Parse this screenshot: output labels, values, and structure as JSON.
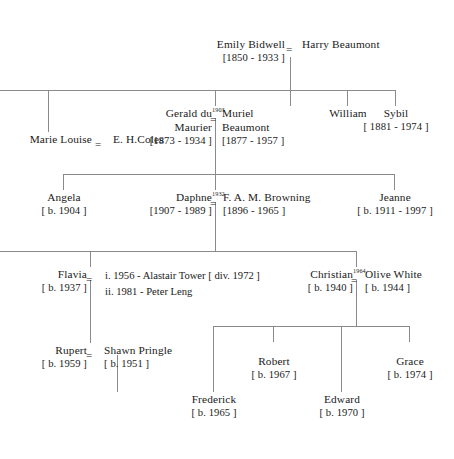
{
  "diagram": {
    "type": "family-tree",
    "line_color": "#8a8a8a",
    "text_color": "#1a1a1a",
    "marriage_symbol": "=",
    "generations": [
      {
        "gen": 1,
        "people": [
          {
            "name": "Emily Bidwell",
            "dates": "[1850 - 1933 ]"
          },
          {
            "name": "Harry Beaumont",
            "dates": ""
          }
        ]
      },
      {
        "gen": 2,
        "people": [
          {
            "name": "Marie Louise",
            "dates": ""
          },
          {
            "name": "E. H.Coles",
            "dates": ""
          },
          {
            "name": "Gerald du Maurier",
            "dates": "[1873 - 1934 ]"
          },
          {
            "name": "Muriel Beaumont",
            "dates": "[1877 - 1957 ]"
          },
          {
            "name": "William",
            "dates": ""
          },
          {
            "name": "Sybil",
            "dates": "[ 1881 - 1974 ]"
          }
        ],
        "marriage_years": [
          "1903"
        ]
      },
      {
        "gen": 3,
        "people": [
          {
            "name": "Angela",
            "dates": "[ b. 1904  ]"
          },
          {
            "name": "Daphne",
            "dates": "[1907 - 1989 ]"
          },
          {
            "name": "F. A. M. Browning",
            "dates": "[1896 - 1965 ]"
          },
          {
            "name": "Jeanne",
            "dates": "[ b. 1911 - 1997 ]"
          }
        ],
        "marriage_years": [
          "1932"
        ]
      },
      {
        "gen": 4,
        "people": [
          {
            "name": "Flavia",
            "dates": "[ b. 1937 ]"
          },
          {
            "name": "Christian",
            "dates": "[ b. 1940 ]"
          },
          {
            "name": "Olive White",
            "dates": "[ b. 1944 ]"
          }
        ],
        "marriage_years": [
          "1964"
        ],
        "notes": [
          "i. 1956 - Alastair Tower [ div. 1972 ]",
          "ii. 1981 - Peter Leng"
        ]
      },
      {
        "gen": 5,
        "people": [
          {
            "name": "Rupert",
            "dates": "[ b. 1959 ]"
          },
          {
            "name": "Shawn Pringle",
            "dates": "[ b. 1951 ]"
          },
          {
            "name": "Robert",
            "dates": "[ b. 1967 ]"
          },
          {
            "name": "Grace",
            "dates": "[ b. 1974 ]"
          }
        ]
      },
      {
        "gen": 6,
        "people": [
          {
            "name": "Frederick",
            "dates": "[ b. 1965 ]"
          },
          {
            "name": "Edward",
            "dates": "[ b. 1970 ]"
          }
        ]
      }
    ]
  },
  "g1": {
    "emily": {
      "name": "Emily Bidwell",
      "dates": "[1850 - 1933 ]"
    },
    "harry": {
      "name": "Harry Beaumont",
      "dates": ""
    },
    "eq": "="
  },
  "g2": {
    "marie": {
      "name": "Marie Louise",
      "dates": ""
    },
    "coles": {
      "name": "E. H.Coles",
      "dates": ""
    },
    "gerald": {
      "name_l1": "Gerald du",
      "name_l2": "Maurier",
      "dates": "[1873 - 1934 ]"
    },
    "muriel": {
      "name_l1": "Muriel",
      "name_l2": "Beaumont",
      "dates": "[1877 - 1957 ]"
    },
    "william": {
      "name": "William",
      "dates": ""
    },
    "sybil": {
      "name": "Sybil",
      "dates": "[ 1881 - 1974 ]"
    },
    "eq_marie": "=",
    "eq_gerald": "=",
    "year_gerald": "1903"
  },
  "g3": {
    "angela": {
      "name": "Angela",
      "dates": "[ b. 1904  ]"
    },
    "daphne": {
      "name": "Daphne",
      "dates": "[1907 - 1989 ]"
    },
    "browning": {
      "name": "F. A. M. Browning",
      "dates": "[1896 - 1965 ]"
    },
    "jeanne": {
      "name": "Jeanne",
      "dates": "[ b. 1911 - 1997 ]"
    },
    "eq_daphne": "=",
    "year_daphne": "1932"
  },
  "g4": {
    "flavia": {
      "name": "Flavia",
      "dates": "[ b. 1937 ]"
    },
    "christian": {
      "name": "Christian",
      "dates": "[ b. 1940 ]"
    },
    "olive": {
      "name": "Olive White",
      "dates": "[ b. 1944 ]"
    },
    "eq_flavia": "=",
    "eq_christian": "=",
    "year_christian": "1964",
    "marriage_1": "i. 1956 - Alastair Tower [ div. 1972 ]",
    "marriage_2": "ii. 1981 - Peter Leng"
  },
  "g5": {
    "rupert": {
      "name": "Rupert",
      "dates": "[ b. 1959 ]"
    },
    "shawn": {
      "name": "Shawn Pringle",
      "dates": "[ b. 1951 ]"
    },
    "robert": {
      "name": "Robert",
      "dates": "[ b. 1967 ]"
    },
    "grace": {
      "name": "Grace",
      "dates": "[ b. 1974 ]"
    },
    "eq_rupert": "="
  },
  "g6": {
    "frederick": {
      "name": "Frederick",
      "dates": "[ b. 1965 ]"
    },
    "edward": {
      "name": "Edward",
      "dates": "[ b. 1970 ]"
    }
  }
}
